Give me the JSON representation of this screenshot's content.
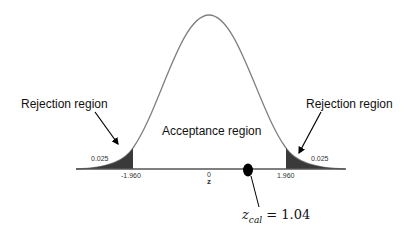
{
  "diagram": {
    "type": "normal-distribution-two-tailed-test",
    "labels": {
      "left_rejection": "Rejection region",
      "right_rejection": "Rejection region",
      "acceptance": "Acceptance region",
      "left_tail_prob": "0.025",
      "right_tail_prob": "0.025",
      "left_critical": "-1.960",
      "right_critical": "1.960",
      "center_tick": "0",
      "axis_label": "z",
      "zcal_symbol": "z",
      "zcal_sub": "cal",
      "zcal_value": "= 1.04"
    },
    "values": {
      "alpha_per_tail": 0.025,
      "critical_left": -1.96,
      "critical_right": 1.96,
      "z_cal": 1.04
    },
    "colors": {
      "curve": "#808080",
      "tail_fill": "#3a3a3a",
      "axis": "#555555",
      "marker": "#000000"
    }
  }
}
